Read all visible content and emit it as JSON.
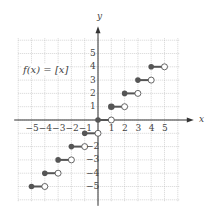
{
  "figure": {
    "function_label": "f(x) = [x]",
    "x_axis_label": "x",
    "y_axis_label": "y",
    "x_ticks": [
      "−5",
      "−4",
      "−3",
      "−2",
      "−1",
      "1",
      "2",
      "3",
      "4",
      "5"
    ],
    "y_ticks_pos": [
      "5",
      "4",
      "3",
      "2",
      "1"
    ],
    "y_ticks_neg": [
      "−2",
      "−3",
      "−4",
      "−5"
    ]
  },
  "chart_data": {
    "type": "step",
    "title": "f(x) = [x]",
    "xlabel": "x",
    "ylabel": "y",
    "xlim": [
      -6,
      6
    ],
    "ylim": [
      -6,
      6
    ],
    "grid": true,
    "segments": [
      {
        "x_start": -5,
        "x_end": -4,
        "y": -5,
        "closed_left": true,
        "open_right": true
      },
      {
        "x_start": -4,
        "x_end": -3,
        "y": -4,
        "closed_left": true,
        "open_right": true
      },
      {
        "x_start": -3,
        "x_end": -2,
        "y": -3,
        "closed_left": true,
        "open_right": true
      },
      {
        "x_start": -2,
        "x_end": -1,
        "y": -2,
        "closed_left": true,
        "open_right": true
      },
      {
        "x_start": -1,
        "x_end": 0,
        "y": -1,
        "closed_left": true,
        "open_right": true
      },
      {
        "x_start": 0,
        "x_end": 1,
        "y": 0,
        "closed_left": true,
        "open_right": true
      },
      {
        "x_start": 1,
        "x_end": 2,
        "y": 1,
        "closed_left": true,
        "open_right": true
      },
      {
        "x_start": 2,
        "x_end": 3,
        "y": 2,
        "closed_left": true,
        "open_right": true
      },
      {
        "x_start": 3,
        "x_end": 4,
        "y": 3,
        "closed_left": true,
        "open_right": true
      },
      {
        "x_start": 4,
        "x_end": 5,
        "y": 4,
        "closed_left": true,
        "open_right": true
      }
    ]
  }
}
